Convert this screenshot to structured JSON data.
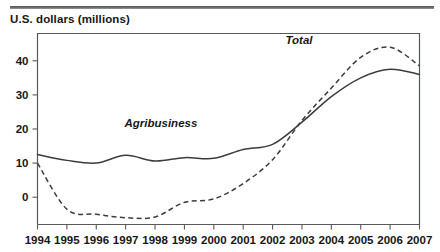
{
  "figure": {
    "axis_title": "U.S. dollars (millions)",
    "rule_color": "#6e6e6e"
  },
  "chart_data": {
    "type": "line",
    "title": "",
    "subtitle": "",
    "xlabel": "",
    "ylabel": "U.S. dollars (millions)",
    "xlim": [
      1994,
      2007
    ],
    "ylim": [
      -8,
      48
    ],
    "yticks": [
      0,
      10,
      20,
      30,
      40
    ],
    "ytick_labels": [
      "0",
      "10",
      "20",
      "30",
      "40"
    ],
    "xticks": [
      1994,
      1995,
      1996,
      1997,
      1998,
      1999,
      2000,
      2001,
      2002,
      2003,
      2004,
      2005,
      2006,
      2007
    ],
    "xtick_labels": [
      "1994",
      "1995",
      "1996",
      "1997",
      "1998",
      "1999",
      "2000",
      "2001",
      "2002",
      "2003",
      "2004",
      "2005",
      "2006",
      "2007"
    ],
    "grid": false,
    "legend": "inline-annotation",
    "x": [
      1994,
      1995,
      1996,
      1997,
      1998,
      1999,
      2000,
      2001,
      2002,
      2003,
      2004,
      2005,
      2006,
      2007
    ],
    "series": [
      {
        "name": "Agribusiness",
        "style": "solid",
        "color": "#3c3c3c",
        "label_x": 1998.2,
        "label_y": 20.5,
        "values": [
          12.5,
          10.8,
          10.0,
          12.3,
          10.6,
          11.6,
          11.4,
          14.0,
          15.5,
          22.0,
          29.5,
          35.0,
          37.5,
          36.0
        ]
      },
      {
        "name": "Total",
        "style": "dashed",
        "color": "#3c3c3c",
        "label_x": 2002.9,
        "label_y": 45.0,
        "values": [
          10.0,
          -3.5,
          -5.0,
          -6.0,
          -5.8,
          -1.5,
          -0.5,
          4.0,
          11.0,
          22.5,
          32.0,
          41.0,
          44.0,
          38.5
        ]
      }
    ],
    "annotations": [
      {
        "text": "Agribusiness",
        "x": 1998.2,
        "y": 20.5
      },
      {
        "text": "Total",
        "x": 2002.9,
        "y": 45.0
      }
    ]
  }
}
